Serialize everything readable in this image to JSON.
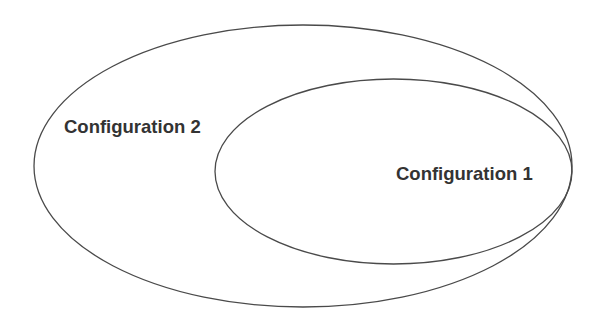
{
  "diagram": {
    "type": "nested-set-diagram",
    "colors": {
      "background": "#ffffff",
      "stroke": "#4a4a4a",
      "label": "#333333"
    },
    "sets": [
      {
        "id": "outer",
        "label": "Configuration 2",
        "contains": [
          "inner"
        ]
      },
      {
        "id": "inner",
        "label": "Configuration 1",
        "contained_in": "outer"
      }
    ]
  }
}
